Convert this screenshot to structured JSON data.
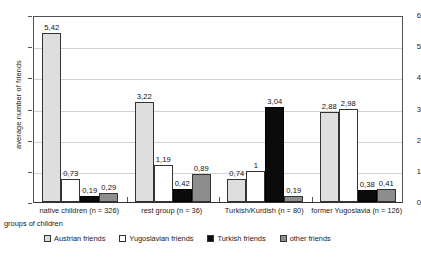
{
  "chart_data": {
    "type": "bar",
    "title": "",
    "xlabel": "groups of children",
    "ylabel": "average number of friends",
    "ylim": [
      0,
      6
    ],
    "yticks": [
      0,
      1,
      2,
      3,
      4,
      5,
      6
    ],
    "grid": true,
    "legend_position": "bottom",
    "decimal_separator": ",",
    "categories": [
      "native children (n = 326)",
      "rest group (n = 36)",
      "Turkish/Kurdish (n = 80)",
      "former Yugoslavia (n = 126)"
    ],
    "series": [
      {
        "name": "Austrian friends",
        "color": "#dedede",
        "values": [
          5.42,
          3.22,
          0.74,
          2.88
        ],
        "labels": [
          "5,42",
          "3,22",
          "0,74",
          "2,88"
        ]
      },
      {
        "name": "Yugoslavian friends",
        "color": "#ffffff",
        "values": [
          0.73,
          1.19,
          1.0,
          2.98
        ],
        "labels": [
          "0,73",
          "1,19",
          "1",
          "2,98"
        ]
      },
      {
        "name": "Turkish friends",
        "color": "#0b0b0b",
        "values": [
          0.19,
          0.42,
          3.04,
          0.38
        ],
        "labels": [
          "0,19",
          "0,42",
          "3,04",
          "0,38"
        ]
      },
      {
        "name": "other friends",
        "color": "#8d8d8d",
        "values": [
          0.29,
          0.89,
          0.19,
          0.41
        ],
        "labels": [
          "0,29",
          "0,89",
          "0,19",
          "0,41"
        ]
      }
    ]
  }
}
